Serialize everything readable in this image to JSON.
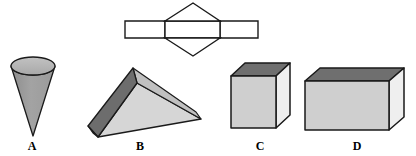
{
  "figure": {
    "background_color": "#ffffff",
    "outline_color": "#1a1a1a",
    "width": 416,
    "height": 156,
    "net": {
      "name": "hexagonal-net",
      "fill_color": "#ffffff",
      "stroke_color": "#1a1a1a",
      "stroke_width": 1.4,
      "left_rect": {
        "x": 125,
        "y": 21,
        "w": 40,
        "h": 17
      },
      "mid_rect": {
        "x": 165,
        "y": 21,
        "w": 55,
        "h": 17
      },
      "right_rect": {
        "x": 220,
        "y": 21,
        "w": 38,
        "h": 17
      },
      "diamond": {
        "top": [
          193,
          3
        ],
        "right": [
          220,
          21
        ],
        "bottom_right": [
          220,
          38
        ],
        "bottom": [
          193,
          56
        ],
        "bottom_left": [
          165,
          38
        ],
        "left": [
          165,
          21
        ]
      }
    },
    "shapes": [
      {
        "id": "cone",
        "label": "A",
        "label_x": 32,
        "label_y": 140,
        "top_fill": "#b4b4b4",
        "body_fill": "#9d9d9d",
        "ellipse": {
          "cx": 33,
          "cy": 66,
          "rx": 22,
          "ry": 9
        },
        "apex": [
          33,
          136
        ]
      },
      {
        "id": "triangular-prism",
        "label": "B",
        "label_x": 140,
        "label_y": 140,
        "top_fill": "#6b6b6b",
        "left_fill": "#8e8e8e",
        "front_fill": "#d4d4d4",
        "right_fill": "#bdbdbd",
        "apex_top": [
          133,
          68
        ],
        "ridge_far": [
          196,
          112
        ],
        "ridge_near": [
          137,
          83
        ],
        "left_back": [
          88,
          126
        ],
        "left_front": [
          98,
          137
        ],
        "right_point": [
          201,
          119
        ]
      },
      {
        "id": "cube",
        "label": "C",
        "label_x": 260,
        "label_y": 140,
        "top_fill": "#6f6f6f",
        "front_fill": "#cfcfcf",
        "side_fill": "#eeeeee",
        "front": {
          "x": 231,
          "y": 76,
          "w": 45,
          "h": 52
        },
        "depth_x": 14,
        "depth_y": 13
      },
      {
        "id": "rectangular-prism",
        "label": "D",
        "label_x": 357,
        "label_y": 140,
        "top_fill": "#6f6f6f",
        "front_fill": "#cfcfcf",
        "side_fill": "#eeeeee",
        "front": {
          "x": 305,
          "y": 81,
          "w": 84,
          "h": 49
        },
        "depth_x": 15,
        "depth_y": 13
      }
    ]
  }
}
